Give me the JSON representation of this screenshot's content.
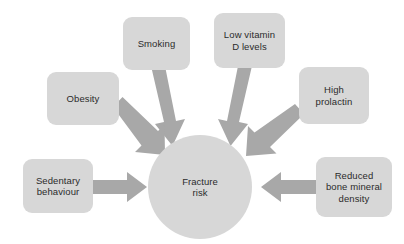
{
  "diagram": {
    "type": "converging-arrow-diagram",
    "colors": {
      "node_fill": "#d7d7d7",
      "arrow_fill": "#a8a8a8",
      "text": "#2b2b2b",
      "background": "#ffffff"
    },
    "center": {
      "label": "Fracture\nrisk",
      "shape": "circle"
    },
    "nodes": [
      {
        "id": "smoking",
        "label": "Smoking"
      },
      {
        "id": "lowvitd",
        "label": "Low vitamin\nD levels"
      },
      {
        "id": "obesity",
        "label": "Obesity"
      },
      {
        "id": "prolactin",
        "label": "High\nprolactin"
      },
      {
        "id": "sedentary",
        "label": "Sedentary\nbehaviour"
      },
      {
        "id": "bmd",
        "label": "Reduced\nbone mineral\ndensity"
      }
    ],
    "arrows": [
      {
        "id": "arrow-smoking",
        "from": "smoking",
        "to": "center",
        "direction": "down-right"
      },
      {
        "id": "arrow-lowvitd",
        "from": "lowvitd",
        "to": "center",
        "direction": "down-left"
      },
      {
        "id": "arrow-obesity",
        "from": "obesity",
        "to": "center",
        "direction": "down-right"
      },
      {
        "id": "arrow-prolactin",
        "from": "prolactin",
        "to": "center",
        "direction": "down-left"
      },
      {
        "id": "arrow-sedentary",
        "from": "sedentary",
        "to": "center",
        "direction": "right"
      },
      {
        "id": "arrow-bmd",
        "from": "bmd",
        "to": "center",
        "direction": "left"
      }
    ]
  }
}
